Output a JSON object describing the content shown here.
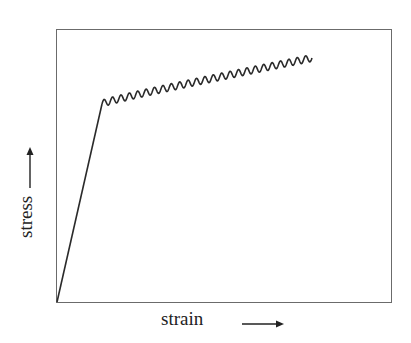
{
  "chart_data": {
    "type": "line",
    "title": "",
    "xlabel": "strain",
    "ylabel": "stress",
    "x_arrow": "right-arrow",
    "y_arrow": "up-arrow",
    "grid": false,
    "ticks": false,
    "series": [
      {
        "name": "elastic region",
        "points_px": [
          [
            57,
            302
          ],
          [
            102,
            104
          ]
        ]
      },
      {
        "name": "serrated plastic flow",
        "start_px": [
          102,
          104
        ],
        "end_px": [
          312,
          58
        ],
        "oscillations": 25,
        "amplitude_px": 3.5
      }
    ]
  },
  "labels": {
    "x_axis": "strain",
    "y_axis": "stress"
  }
}
